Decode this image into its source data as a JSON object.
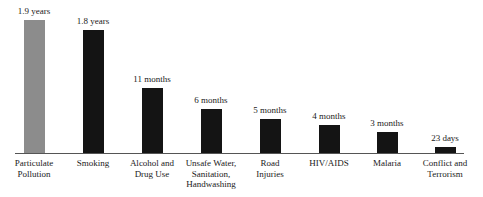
{
  "chart_data": {
    "type": "bar",
    "title": "",
    "xlabel": "",
    "ylabel": "",
    "grid": false,
    "legend": null,
    "unit_note": "Values are reduction in life expectancy; labels shown above bars",
    "categories": [
      "Particulate\nPollution",
      "Smoking",
      "Alcohol and\nDrug Use",
      "Unsafe Water,\nSanitation,\nHandwashing",
      "Road\nInjuries",
      "HIV/AIDS",
      "Malaria",
      "Conflict and\nTerrorism"
    ],
    "labels": [
      "1.9 years",
      "1.8 years",
      "11 months",
      "6 months",
      "5 months",
      "4 months",
      "3 months",
      "23 days"
    ],
    "values_years": [
      1.9,
      1.8,
      0.917,
      0.5,
      0.417,
      0.333,
      0.25,
      0.063
    ],
    "colors": [
      "#8c8c8c",
      "#141414",
      "#141414",
      "#141414",
      "#141414",
      "#141414",
      "#141414",
      "#141414"
    ],
    "ylim": [
      0,
      2.0
    ]
  },
  "layout": {
    "centers": [
      34,
      93,
      152,
      211,
      270,
      329,
      387,
      445
    ],
    "tops": [
      20,
      30,
      88,
      109,
      119,
      125,
      132,
      147
    ],
    "baseline": 153
  }
}
